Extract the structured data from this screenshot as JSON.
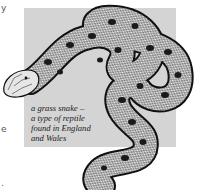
{
  "figure": {
    "panel_color": "#d4d4d4",
    "caption_lines": [
      "a grass snake –",
      "a type of reptile",
      "found in England",
      "and Wales"
    ]
  },
  "margin_fragments": [
    "y",
    "e",
    "."
  ]
}
